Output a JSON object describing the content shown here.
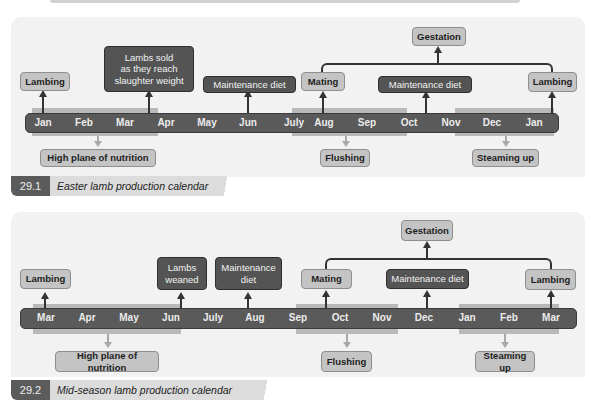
{
  "calendars": [
    {
      "number": "29.1",
      "caption": "Easter lamb production calendar",
      "months": [
        "Jan",
        "Feb",
        "Mar",
        "Apr",
        "May",
        "Jun",
        "July",
        "Aug",
        "Sep",
        "Oct",
        "Nov",
        "Dec",
        "Jan"
      ],
      "above": {
        "lambing_start": "Lambing",
        "lambs_sold": "Lambs sold\nas they reach\nslaughter weight",
        "maintenance_1": "Maintenance diet",
        "mating": "Mating",
        "maintenance_2": "Maintenance diet",
        "lambing_end": "Lambing",
        "gestation": "Gestation"
      },
      "below": {
        "high_plane": "High plane of nutrition",
        "flushing": "Flushing",
        "steaming_up": "Steaming up"
      }
    },
    {
      "number": "29.2",
      "caption": "Mid-season lamb production calendar",
      "months": [
        "Mar",
        "Apr",
        "May",
        "Jun",
        "July",
        "Aug",
        "Sep",
        "Oct",
        "Nov",
        "Dec",
        "Jan",
        "Feb",
        "Mar"
      ],
      "above": {
        "lambing_start": "Lambing",
        "lambs_weaned": "Lambs\nweaned",
        "maintenance_1": "Maintenance\ndiet",
        "mating": "Mating",
        "maintenance_2": "Maintenance diet",
        "lambing_end": "Lambing",
        "gestation": "Gestation"
      },
      "below": {
        "high_plane": "High plane of nutrition",
        "flushing": "Flushing",
        "steaming_up": "Steaming up"
      }
    }
  ],
  "colors": {
    "panel_bg": "#f2f2f2",
    "timeline_bar": "#5a5a5a",
    "light_box": "#c4c4c4",
    "dark_box": "#545454",
    "shade_band": "#b9b9b9"
  }
}
